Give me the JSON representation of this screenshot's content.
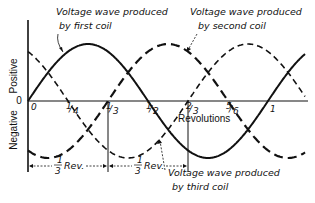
{
  "diagram": {
    "y_axis": {
      "positive_label": "Positive",
      "zero_label": "0",
      "negative_label": "Negative"
    },
    "x_axis": {
      "label": "Revolutions",
      "origin_label": "0",
      "ticks": [
        {
          "label": "1/4",
          "num": "1",
          "den": "4",
          "x": 68
        },
        {
          "label": "1/3",
          "num": "1",
          "den": "3",
          "x": 108
        },
        {
          "label": "1/2",
          "num": "1",
          "den": "2",
          "x": 148
        },
        {
          "label": "2/3",
          "num": "2",
          "den": "3",
          "x": 188
        },
        {
          "label": "5/6",
          "num": "5",
          "den": "6",
          "x": 228
        },
        {
          "label": "1",
          "num": "1",
          "den": "",
          "x": 268
        }
      ]
    },
    "waves": [
      {
        "name": "first coil",
        "label_line1": "Voltage wave produced",
        "label_line2": "by first coil",
        "phase_deg": 0,
        "style": "solid"
      },
      {
        "name": "second coil",
        "label_line1": "Voltage wave produced",
        "label_line2": "by second coil",
        "phase_deg": -120,
        "style": "long-dash"
      },
      {
        "name": "third coil",
        "label_line1": "Voltage wave produced",
        "label_line2": "by third coil",
        "phase_deg": 120,
        "style": "dash"
      }
    ],
    "dimensions": [
      {
        "label_num": "1",
        "label_den": "3",
        "label_text": "Rev."
      },
      {
        "label_num": "1",
        "label_den": "3",
        "label_text": "Rev."
      }
    ]
  }
}
